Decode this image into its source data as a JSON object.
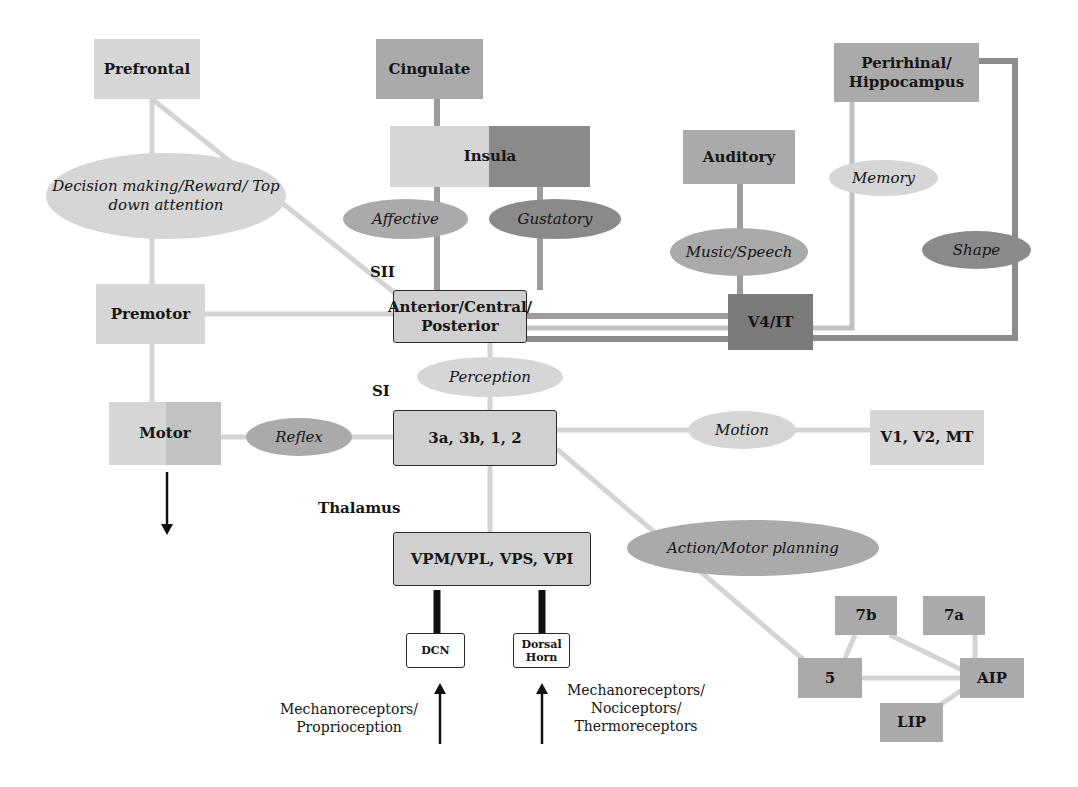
{
  "regions": {
    "prefrontal": "Prefrontal",
    "cingulate": "Cingulate",
    "insula": "Insula",
    "auditory": "Auditory",
    "perirhinal": "Perirhinal/ Hippocampus",
    "premotor": "Premotor",
    "sii_box": "Anterior/Central/ Posterior",
    "v4it": "V4/IT",
    "motor": "Motor",
    "si_box": "3a, 3b, 1, 2",
    "v1v2mt": "V1, V2, MT",
    "thalamus_box": "VPM/VPL, VPS, VPI",
    "dcn": "DCN",
    "dorsal_horn": "Dorsal Horn",
    "area_7b": "7b",
    "area_7a": "7a",
    "area_5": "5",
    "aip": "AIP",
    "lip": "LIP"
  },
  "functions": {
    "decision": "Decision making/Reward/ Top down attention",
    "affective": "Affective",
    "gustatory": "Gustatory",
    "memory": "Memory",
    "music": "Music/Speech",
    "shape": "Shape",
    "perception": "Perception",
    "reflex": "Reflex",
    "motion": "Motion",
    "action": "Action/Motor planning"
  },
  "labels": {
    "sii": "SII",
    "si": "SI",
    "thalamus": "Thalamus",
    "input_left": "Mechanoreceptors/ Proprioception",
    "input_right": "Mechanoreceptors/ Nociceptors/ Thermoreceptors"
  },
  "colors": {
    "light": "#d6d6d6",
    "mid": "#aaaaaa",
    "dark": "#8a8a8a",
    "darker": "#7a7a7a",
    "outline": "#2a2a2a"
  }
}
